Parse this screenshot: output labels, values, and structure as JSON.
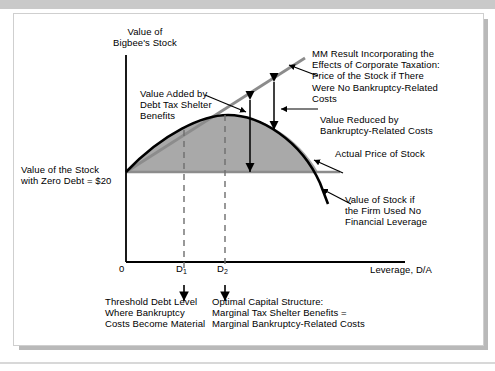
{
  "figure": {
    "type": "diagram",
    "axes": {
      "y_title_line1": "Value of",
      "y_title_line2": "Bigbee's Stock",
      "x_title": "Leverage, D/A",
      "origin_tick": "0",
      "tick_d1": "D",
      "tick_d1_sub": "1",
      "tick_d2": "D",
      "tick_d2_sub": "2"
    },
    "annotations": {
      "value_added": "Value Added by\nDebt Tax Shelter\nBenefits",
      "zero_debt": "Value of the Stock\nwith Zero Debt = $20",
      "mm_result": "MM Result Incorporating the\nEffects of Corporate Taxation:\nPrice of the Stock if There\nWere No Bankruptcy-Related\nCosts",
      "value_reduced": "Value Reduced by\nBankruptcy-Related Costs",
      "actual_price": "Actual Price of Stock",
      "no_leverage": "Value of Stock if\nthe Firm Used No\nFinancial Leverage",
      "threshold": "Threshold Debt Level\nWhere Bankruptcy\nCosts Become Material",
      "optimal": "Optimal Capital Structure:\nMarginal Tax Shelter Benefits =\nMarginal Bankruptcy-Related Costs"
    },
    "values": {
      "zero_debt_stock_price": "$20"
    },
    "colors": {
      "mm_line": "#8c8c8c",
      "actual_curve": "#000000",
      "shaded_area": "#a9a9a9",
      "baseline": "#8c8c8c",
      "axis": "#000000",
      "dashed": "#6e6e6e",
      "frame_band": "#c9c9c9",
      "page_background": "#ffffff"
    }
  }
}
